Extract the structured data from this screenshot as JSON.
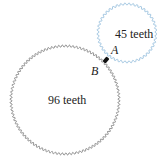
{
  "diagram": {
    "large_gear": {
      "label": "96 teeth",
      "teeth": 96,
      "color": "#8a8a8a"
    },
    "small_gear": {
      "label": "45 teeth",
      "teeth": 45,
      "color": "#9cc3e0"
    },
    "point_a": {
      "label": "A"
    },
    "point_b": {
      "label": "B"
    },
    "contact_marker_color": "#111111"
  }
}
